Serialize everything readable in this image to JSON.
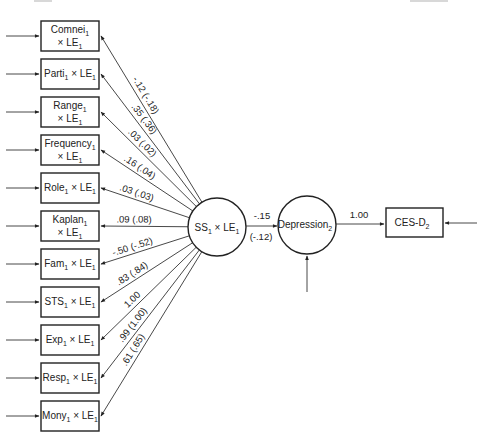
{
  "diagram": {
    "type": "structural-equation-path-diagram",
    "indicators": [
      {
        "id": "comnei",
        "line1": "Comnei",
        "sub1": "1",
        "line2": "× LE",
        "sub2": "1",
        "loading": "-.12 (-.18)",
        "two_line": true
      },
      {
        "id": "parti",
        "line1": "Parti",
        "sub1": "1",
        "line2": " × LE",
        "sub2": "1",
        "loading": ".35 (.36)",
        "two_line": false
      },
      {
        "id": "range",
        "line1": "Range",
        "sub1": "1",
        "line2": "× LE",
        "sub2": "1",
        "loading": ".03 (.02)",
        "two_line": true
      },
      {
        "id": "frequency",
        "line1": "Frequency",
        "sub1": "1",
        "line2": "× LE",
        "sub2": "1",
        "loading": ".16 (.04)",
        "two_line": true
      },
      {
        "id": "role",
        "line1": "Role",
        "sub1": "1",
        "line2": " × LE",
        "sub2": "1",
        "loading": ".03 (.03)",
        "two_line": false
      },
      {
        "id": "kaplan",
        "line1": "Kaplan",
        "sub1": "1",
        "line2": "× LE",
        "sub2": "1",
        "loading": ".09 (.08)",
        "two_line": true
      },
      {
        "id": "fam",
        "line1": "Fam",
        "sub1": "1",
        "line2": " × LE",
        "sub2": "1",
        "loading": "-.50 (-.52)",
        "two_line": false
      },
      {
        "id": "sts",
        "line1": "STS",
        "sub1": "1",
        "line2": " × LE",
        "sub2": "1",
        "loading": ".83 (.84)",
        "two_line": false
      },
      {
        "id": "exp",
        "line1": "Exp",
        "sub1": "1",
        "line2": " × LE",
        "sub2": "1",
        "loading": "1.00",
        "two_line": false
      },
      {
        "id": "resp",
        "line1": "Resp",
        "sub1": "1",
        "line2": " × LE",
        "sub2": "1",
        "loading": ".99 (1.00)",
        "two_line": false
      },
      {
        "id": "mony",
        "line1": "Mony",
        "sub1": "1",
        "line2": " × LE",
        "sub2": "1",
        "loading": ".61 (.65)",
        "two_line": false
      }
    ],
    "latent_interaction": {
      "main": "SS",
      "sub1": "1",
      "mid": " × LE",
      "sub2": "1"
    },
    "latent_outcome": {
      "main": "Depression",
      "sub": "2"
    },
    "observed_outcome": {
      "main": "CES-D",
      "sub": "2"
    },
    "path_interaction_to_depression": {
      "estimate": "-.15",
      "alt_estimate": "(-.12)"
    },
    "path_depression_to_cesd": {
      "estimate": "1.00"
    }
  }
}
